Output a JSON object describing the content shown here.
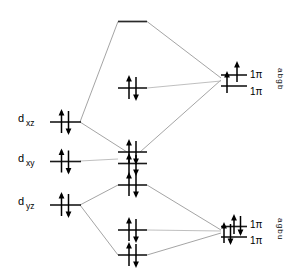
{
  "diagram": {
    "kind": "mo-correlation",
    "background_color": "#ffffff",
    "level_color": "#1a1a1a",
    "correlation_line_color": "#9a9a9a",
    "electron_color": "#000000"
  },
  "left_labels": [
    {
      "id": "dxz",
      "main": "d",
      "sub": "xz",
      "x": 22,
      "y": 122
    },
    {
      "id": "dxy",
      "main": "d",
      "sub": "xy",
      "x": 22,
      "y": 162
    },
    {
      "id": "dyz",
      "main": "d",
      "sub": "yz",
      "x": 22,
      "y": 205
    }
  ],
  "right_labels": [
    {
      "id": "pi-top-upper",
      "text": "1π",
      "sub": "g",
      "x": 250,
      "y": 77
    },
    {
      "id": "pi-top-lower",
      "text": "1π",
      "sub": "u",
      "x": 250,
      "y": 94
    },
    {
      "id": "pi-bot-upper",
      "text": "1π",
      "sub": "g",
      "x": 250,
      "y": 227
    },
    {
      "id": "pi-bot-lower",
      "text": "1π",
      "sub": "u",
      "x": 250,
      "y": 243
    }
  ],
  "rotated_label_groups": [
    {
      "id": "top-rotated-stack",
      "text": "abgb",
      "letters": [
        "a",
        "b",
        "g",
        "b"
      ],
      "x": 276,
      "y": 70
    },
    {
      "id": "bottom-rotated-stack",
      "text": "agbu",
      "letters": [
        "a",
        "g",
        "b",
        "u"
      ],
      "x": 276,
      "y": 220
    }
  ],
  "left_levels": [
    {
      "id": "dxz-level",
      "x1": 50,
      "x2": 80,
      "y": 122,
      "electrons": 2,
      "label": "d_xz"
    },
    {
      "id": "dxy-level",
      "x1": 50,
      "x2": 80,
      "y": 162,
      "electrons": 2,
      "label": "d_xy"
    },
    {
      "id": "dyz-level",
      "x1": 50,
      "x2": 80,
      "y": 205,
      "electrons": 2,
      "label": "d_yz"
    }
  ],
  "middle_levels": [
    {
      "id": "top-empty-level",
      "x1": 118,
      "x2": 147,
      "y": 22,
      "electrons": 0,
      "label": "antibonding-empty"
    },
    {
      "id": "mid-upper-level",
      "x1": 118,
      "x2": 147,
      "y": 88,
      "electrons": 2,
      "label": "pi-mid-upper"
    },
    {
      "id": "xy-nonbonding-upper",
      "x1": 118,
      "x2": 147,
      "y": 152,
      "electrons": 2,
      "label": "dxy-nonbonding-upper"
    },
    {
      "id": "xy-nonbonding-lower",
      "x1": 118,
      "x2": 147,
      "y": 163,
      "electrons": 2,
      "label": "dxy-nonbonding-lower"
    },
    {
      "id": "mid-lower-a",
      "x1": 118,
      "x2": 147,
      "y": 185,
      "electrons": 2,
      "label": "pi-mid-lower-a"
    },
    {
      "id": "mid-lower-b",
      "x1": 118,
      "x2": 147,
      "y": 230,
      "electrons": 2,
      "label": "pi-mid-lower-b"
    },
    {
      "id": "mid-lower-c",
      "x1": 118,
      "x2": 147,
      "y": 255,
      "electrons": 2,
      "label": "pi-mid-lower-c"
    }
  ],
  "right_levels": [
    {
      "id": "right-top-upper",
      "x1": 222,
      "x2": 247,
      "y": 75,
      "electrons": 1,
      "label": "1pi-g-top"
    },
    {
      "id": "right-top-lower",
      "x1": 222,
      "x2": 247,
      "y": 86,
      "electrons": 1,
      "label": "1pi-u-top"
    },
    {
      "id": "right-bot-upper",
      "x1": 222,
      "x2": 247,
      "y": 227,
      "electrons": 2,
      "label": "1pi-g-bottom"
    },
    {
      "id": "right-bot-lower",
      "x1": 222,
      "x2": 247,
      "y": 237,
      "electrons": 2,
      "label": "1pi-u-bottom"
    }
  ],
  "correlation_lines": [
    {
      "id": "dxz-to-top",
      "from": "dxz-level",
      "to": "top-empty-level",
      "x1": 80,
      "y1": 122,
      "x2": 118,
      "y2": 22
    },
    {
      "id": "top-to-right",
      "from": "top-empty-level",
      "to": "right-top",
      "x1": 147,
      "y1": 22,
      "x2": 222,
      "y2": 78
    },
    {
      "id": "dxz-to-xy-node",
      "from": "dxz-level",
      "to": "xy-node",
      "x1": 80,
      "y1": 122,
      "x2": 130,
      "y2": 152
    },
    {
      "id": "xy-node-to-right",
      "from": "xy-node",
      "to": "right-top",
      "x1": 147,
      "y1": 152,
      "x2": 222,
      "y2": 82
    },
    {
      "id": "midflat-upper",
      "from": "mid-upper-level",
      "to": "right-top",
      "x1": 147,
      "y1": 88,
      "x2": 222,
      "y2": 82
    },
    {
      "id": "dxy-flat",
      "from": "dxy-level",
      "to": "xy-node",
      "x1": 80,
      "y1": 162,
      "x2": 118,
      "y2": 160
    },
    {
      "id": "dyz-to-midlower-a",
      "from": "dyz-level",
      "to": "mid-lower-a",
      "x1": 80,
      "y1": 205,
      "x2": 118,
      "y2": 185
    },
    {
      "id": "midlower-a-to-right",
      "from": "mid-lower-a",
      "to": "right-bot",
      "x1": 147,
      "y1": 185,
      "x2": 222,
      "y2": 230
    },
    {
      "id": "dyz-to-midlower-c",
      "from": "dyz-level",
      "to": "mid-lower-c",
      "x1": 80,
      "y1": 205,
      "x2": 118,
      "y2": 255
    },
    {
      "id": "midlower-c-to-right",
      "from": "mid-lower-c",
      "to": "right-bot",
      "x1": 147,
      "y1": 255,
      "x2": 222,
      "y2": 233
    },
    {
      "id": "midlower-b-flat",
      "from": "mid-lower-b",
      "to": "right-bot",
      "x1": 147,
      "y1": 230,
      "x2": 222,
      "y2": 231
    }
  ],
  "counts": {
    "left_levels": 3,
    "middle_levels": 7,
    "right_levels": 4,
    "total_electron_arrows": 26
  }
}
